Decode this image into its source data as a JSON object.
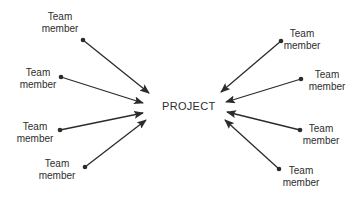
{
  "diagram": {
    "type": "hub-and-spoke",
    "center": {
      "label": "PROJECT",
      "x": 162,
      "y": 100
    },
    "arrow_color": "#2b2b2b",
    "nodes": [
      {
        "side": "left",
        "line1": "Team",
        "line2": "member",
        "label_x": 60,
        "label_y": 11,
        "dot": [
          83,
          40
        ],
        "tip": [
          149,
          93
        ]
      },
      {
        "side": "left",
        "line1": "Team",
        "line2": "member",
        "label_x": 38,
        "label_y": 67,
        "dot": [
          61,
          77
        ],
        "tip": [
          143,
          103
        ]
      },
      {
        "side": "left",
        "line1": "Team",
        "line2": "member",
        "label_x": 35,
        "label_y": 121,
        "dot": [
          60,
          130
        ],
        "tip": [
          143,
          113
        ]
      },
      {
        "side": "left",
        "line1": "Team",
        "line2": "member",
        "label_x": 57,
        "label_y": 158,
        "dot": [
          85,
          167
        ],
        "tip": [
          146,
          120
        ]
      },
      {
        "side": "right",
        "line1": "Team",
        "line2": "member",
        "label_x": 302,
        "label_y": 28,
        "dot": [
          281,
          41
        ],
        "tip": [
          221,
          92
        ]
      },
      {
        "side": "right",
        "line1": "Team",
        "line2": "member",
        "label_x": 327,
        "label_y": 69,
        "dot": [
          301,
          79
        ],
        "tip": [
          226,
          102
        ]
      },
      {
        "side": "right",
        "line1": "Team",
        "line2": "member",
        "label_x": 321,
        "label_y": 123,
        "dot": [
          300,
          130
        ],
        "tip": [
          227,
          112
        ]
      },
      {
        "side": "right",
        "line1": "Team",
        "line2": "member",
        "label_x": 301,
        "label_y": 165,
        "dot": [
          279,
          169
        ],
        "tip": [
          225,
          120
        ]
      }
    ]
  }
}
